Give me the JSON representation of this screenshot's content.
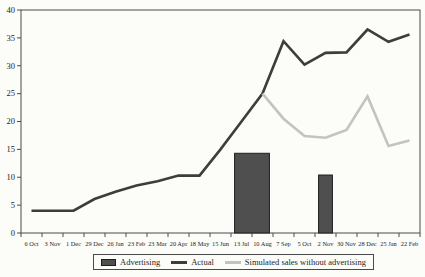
{
  "chart_data": {
    "type": "combo",
    "title": "",
    "xlabel": "",
    "ylabel": "",
    "categories": [
      "6 Oct",
      "3 Nov",
      "1 Dec",
      "29 Dec",
      "26 Jan",
      "23 Feb",
      "23 Mar",
      "20 Apr",
      "18 May",
      "15 Jun",
      "13 Jul",
      "10 Aug",
      "7 Sep",
      "5 Oct",
      "2 Nov",
      "30 Nov",
      "28 Dec",
      "25 Jan",
      "22 Feb"
    ],
    "ylim": [
      0,
      40
    ],
    "yticks": [
      0,
      5,
      10,
      15,
      20,
      25,
      30,
      35,
      40
    ],
    "grid": false,
    "legend_position": "bottom",
    "axis_color": "#4a4a4a",
    "background": "#fcfcf9",
    "series": [
      {
        "name": "Advertising",
        "type": "bar",
        "color": "#4f4f4f",
        "border_color": "#1f1f1f",
        "bars": [
          {
            "from": "13 Jul",
            "to": "10 Aug",
            "value": 14.3
          },
          {
            "from": "2 Nov",
            "to": "2 Nov",
            "value": 10.4
          }
        ]
      },
      {
        "name": "Actual",
        "type": "line",
        "color": "#3d3d3d",
        "values": [
          4,
          4,
          4,
          6.1,
          7.4,
          8.5,
          9.3,
          10.3,
          10.3,
          15,
          20,
          25,
          34.4,
          30.2,
          32.3,
          32.4,
          36.5,
          34.3,
          35.6
        ]
      },
      {
        "name": "Simulated sales without advertising",
        "type": "line",
        "color": "#c3c3c3",
        "values": [
          null,
          null,
          null,
          null,
          null,
          null,
          null,
          null,
          null,
          null,
          null,
          25,
          20.5,
          17.4,
          17.1,
          18.5,
          24.5,
          15.6,
          16.6
        ]
      }
    ]
  }
}
